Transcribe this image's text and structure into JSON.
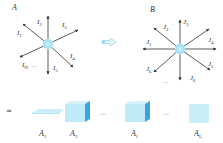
{
  "graph_a": {
    "title": "A",
    "edge_labels": [
      "I1",
      "I2",
      "I3",
      "I4",
      "I5",
      "IN"
    ],
    "edges": [
      {
        "label_main": "I",
        "label_sub": "1"
      },
      {
        "label_main": "I",
        "label_sub": "2"
      },
      {
        "label_main": "I",
        "label_sub": "3"
      },
      {
        "label_main": "I",
        "label_sub": "4"
      },
      {
        "label_main": "I",
        "label_sub": "5"
      },
      {
        "label_main": "I",
        "label_sub": "N"
      }
    ],
    "ellipsis": "⋯"
  },
  "graph_b": {
    "title": "B",
    "edges": [
      {
        "label_main": "J",
        "label_sub": "1"
      },
      {
        "label_main": "J",
        "label_sub": "2"
      },
      {
        "label_main": "J",
        "label_sub": "3"
      },
      {
        "label_main": "J",
        "label_sub": "4"
      },
      {
        "label_main": "J",
        "label_sub": "5"
      },
      {
        "label_main": "J",
        "label_sub": "6"
      },
      {
        "label_main": "J",
        "label_sub": "L"
      }
    ],
    "ellipsis": "⋯"
  },
  "transform_arrow": "⇨",
  "approx_symbol": "≈",
  "blocks": [
    {
      "label_main": "A",
      "label_sub": "1",
      "shape": "flat-slab"
    },
    {
      "label_main": "A",
      "label_sub": "2",
      "shape": "cube"
    },
    {
      "label_main": "A",
      "label_sub": "l",
      "shape": "cube"
    },
    {
      "label_main": "A",
      "label_sub": "L",
      "shape": "square"
    }
  ],
  "block_ellipsis": [
    "⋯",
    "⋯"
  ],
  "colors": {
    "node": "#a9e4f7",
    "node_glow": "#d8f4fc",
    "cube_front": "#bfeaf8",
    "cube_side": "#3aa6de",
    "cube_top": "#d6f3fc",
    "slab": "#cdeffa",
    "arrow": "#333333",
    "transform_arrow": "#9ed8f0"
  }
}
